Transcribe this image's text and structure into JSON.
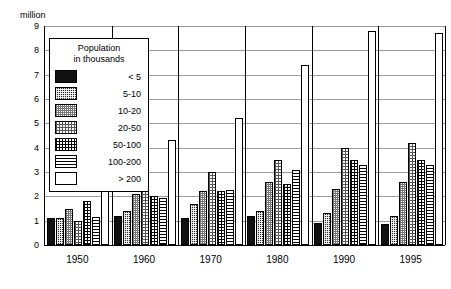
{
  "chart_data": {
    "type": "bar",
    "title": "",
    "subtitle": "",
    "unit_label": "million",
    "xlabel": "",
    "ylabel": "million",
    "ylim": [
      0,
      9
    ],
    "ytick_labels": [
      "0",
      "1",
      "2",
      "3",
      "4",
      "5",
      "6",
      "7",
      "8",
      "9"
    ],
    "ytick_values": [
      0,
      1,
      2,
      3,
      4,
      5,
      6,
      7,
      8,
      9
    ],
    "grid": true,
    "legend_position": "upper-left-inside",
    "legend_title_line1": "Population",
    "legend_title_line2": "in thousands",
    "categories": [
      "1950",
      "1960",
      "1970",
      "1980",
      "1990",
      "1995"
    ],
    "series": [
      {
        "name": "< 5",
        "pattern": "solid-black",
        "values": [
          1.1,
          1.2,
          1.1,
          1.2,
          0.9,
          0.85
        ]
      },
      {
        "name": "5-10",
        "pattern": "dark-crosshatch",
        "values": [
          1.1,
          1.4,
          1.7,
          1.4,
          1.3,
          1.2
        ]
      },
      {
        "name": "10-20",
        "pattern": "light-dot-grid",
        "values": [
          1.5,
          2.1,
          2.2,
          2.6,
          2.3,
          2.6
        ]
      },
      {
        "name": "20-50",
        "pattern": "medium-dot-grid",
        "values": [
          1.0,
          2.6,
          3.0,
          3.5,
          4.0,
          4.2
        ]
      },
      {
        "name": "50-100",
        "pattern": "fine-grid",
        "values": [
          1.8,
          2.0,
          2.2,
          2.5,
          3.5,
          3.5
        ]
      },
      {
        "name": "100-200",
        "pattern": "horizontal-lines",
        "values": [
          1.15,
          1.95,
          2.25,
          3.1,
          3.3,
          3.3
        ]
      },
      {
        "name": "> 200",
        "pattern": "white",
        "values": [
          2.9,
          4.3,
          5.2,
          7.4,
          8.8,
          8.7
        ]
      }
    ]
  },
  "legend": {
    "title_line1": "Population",
    "title_line2": "in thousands",
    "items": [
      {
        "label": "< 5"
      },
      {
        "label": "5-10"
      },
      {
        "label": "10-20"
      },
      {
        "label": "20-50"
      },
      {
        "label": "50-100"
      },
      {
        "label": "100-200"
      },
      {
        "label": "> 200"
      }
    ]
  },
  "axes": {
    "unit_caption": "million"
  }
}
